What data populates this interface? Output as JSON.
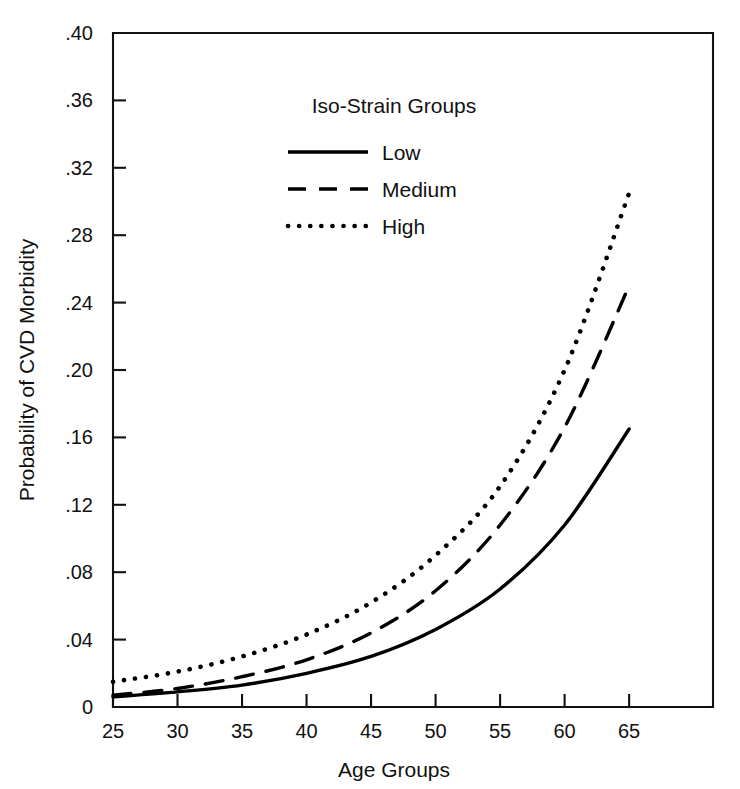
{
  "chart_data": {
    "type": "line",
    "title": "",
    "xlabel": "Age Groups",
    "ylabel": "Probability of CVD Morbidity",
    "xlim": [
      25,
      71.5
    ],
    "ylim": [
      0,
      0.4
    ],
    "grid": false,
    "legend_position": "top-center",
    "legend_title": "Iso-Strain Groups",
    "x_ticks": [
      25,
      30,
      35,
      40,
      45,
      50,
      55,
      60,
      65
    ],
    "x_tick_labels": [
      "25",
      "30",
      "35",
      "40",
      "45",
      "50",
      "55",
      "60",
      "65"
    ],
    "y_ticks": [
      0,
      0.04,
      0.08,
      0.12,
      0.16,
      0.2,
      0.24,
      0.28,
      0.32,
      0.36,
      0.4
    ],
    "y_tick_labels": [
      "0",
      ".04",
      ".08",
      ".12",
      ".16",
      ".20",
      ".24",
      ".28",
      ".32",
      ".36",
      ".40"
    ],
    "x": [
      25,
      30,
      35,
      40,
      45,
      50,
      55,
      60,
      65
    ],
    "series": [
      {
        "name": "Low",
        "style": "solid",
        "values": [
          0.006,
          0.009,
          0.013,
          0.02,
          0.03,
          0.046,
          0.07,
          0.108,
          0.165
        ]
      },
      {
        "name": "Medium",
        "style": "dashed",
        "values": [
          0.007,
          0.011,
          0.018,
          0.028,
          0.044,
          0.069,
          0.108,
          0.166,
          0.25
        ]
      },
      {
        "name": "High",
        "style": "dotted",
        "values": [
          0.015,
          0.021,
          0.03,
          0.043,
          0.062,
          0.09,
          0.131,
          0.2,
          0.305
        ]
      }
    ]
  },
  "legend": {
    "title": "Iso-Strain Groups",
    "items": [
      {
        "label": "Low",
        "style": "solid"
      },
      {
        "label": "Medium",
        "style": "dashed"
      },
      {
        "label": "High",
        "style": "dotted"
      }
    ]
  },
  "axes": {
    "x_title": "Age Groups",
    "y_title": "Probability of CVD Morbidity"
  },
  "colors": {
    "background": "#ffffff",
    "ink": "#111111",
    "series": "#000000"
  }
}
